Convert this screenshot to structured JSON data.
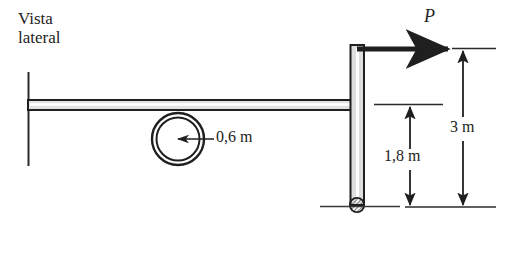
{
  "figure": {
    "kind": "side-view-mechanics-diagram",
    "view_label": "Vista\nlateral",
    "force_label": "P",
    "wheel_dimension_label": "0,6 m",
    "lower_dimension_label": "1,8 m",
    "total_dimension_label": "3 m",
    "line_color": "#1f1f1f",
    "fill_color": "#d9d9d9",
    "background_color": "#ffffff"
  },
  "geometry": {
    "beam": {
      "x1": 28,
      "x2": 360,
      "y_top": 100,
      "y_bottom": 110
    },
    "left_reference_line": {
      "x": 28,
      "y1": 72,
      "y2": 166
    },
    "post": {
      "x_left": 351,
      "x_right": 364,
      "y_top": 45,
      "y_bottom": 205
    },
    "wheel": {
      "cx": 178,
      "cy": 139,
      "r_outer": 26,
      "r_inner": 22
    },
    "wheel_radius_arrow": {
      "x1": 178,
      "y1": 139,
      "x2": 214,
      "y2": 139
    },
    "force_arrow": {
      "x1": 360,
      "y1": 49,
      "x2": 450,
      "y2": 49
    },
    "pin_support": {
      "cx": 357,
      "cy": 205,
      "r": 7
    },
    "ground_line": {
      "x1": 320,
      "x2": 400,
      "y": 206
    },
    "dimension_baseline": {
      "x1": 405,
      "x2": 496,
      "y": 207
    },
    "extension_line_top": {
      "x1": 452,
      "x2": 496,
      "y": 49
    },
    "extension_line_mid": {
      "x1": 375,
      "x2": 443,
      "y": 105
    },
    "dimension_lower": {
      "x": 410,
      "y1": 105,
      "y2": 207
    },
    "dimension_total": {
      "x": 463,
      "y1": 49,
      "y2": 207
    }
  }
}
